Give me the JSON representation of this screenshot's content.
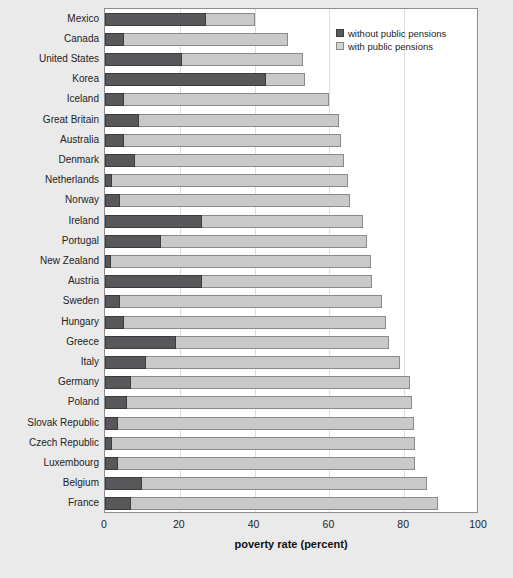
{
  "chart_data": {
    "type": "bar",
    "orientation": "horizontal",
    "stacked": true,
    "title": "",
    "xlabel": "poverty rate (percent)",
    "ylabel": "",
    "xlim": [
      0,
      100
    ],
    "xticks": [
      0,
      20,
      40,
      60,
      80,
      100
    ],
    "xtick_labels": [
      "0",
      "20",
      "40",
      "60",
      "80",
      "100"
    ],
    "grid": true,
    "legend_position": "top-right",
    "legend": [
      "without public pensions",
      "with public pensions"
    ],
    "categories": [
      "Mexico",
      "Canada",
      "United States",
      "Korea",
      "Iceland",
      "Great Britain",
      "Australia",
      "Denmark",
      "Netherlands",
      "Norway",
      "Ireland",
      "Portugal",
      "New Zealand",
      "Austria",
      "Sweden",
      "Hungary",
      "Greece",
      "Italy",
      "Germany",
      "Poland",
      "Slovak Republic",
      "Czech Republic",
      "Luxembourg",
      "Belgium",
      "France"
    ],
    "series": [
      {
        "name": "without public pensions",
        "color": "#58585a",
        "values": [
          27,
          5,
          20.5,
          43,
          5,
          9,
          5,
          8,
          2,
          4,
          26,
          15,
          1.5,
          26,
          4,
          5,
          19,
          11,
          7,
          6,
          3.5,
          2,
          3.5,
          10,
          7
        ]
      },
      {
        "name": "with public pensions",
        "color": "#c9c9c9",
        "values": [
          40,
          49,
          53,
          53.5,
          60,
          62.5,
          63,
          64,
          65,
          65.5,
          69,
          70,
          71,
          71.5,
          74,
          75,
          76,
          79,
          81.5,
          82,
          82.5,
          82.8,
          83,
          86,
          89
        ]
      }
    ]
  }
}
